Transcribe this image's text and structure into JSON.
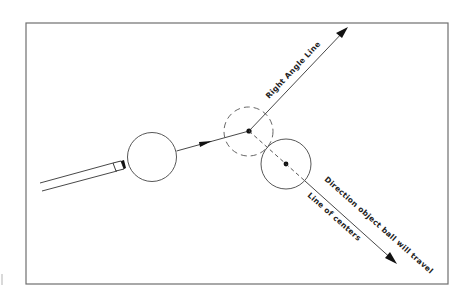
{
  "diagram": {
    "labels": {
      "right_angle_line": "Right Angle Line",
      "direction_object_ball": "Direction object ball will travel",
      "line_of_centers": "Line of centers"
    },
    "elements": {
      "cue_stick": "cue-stick",
      "cue_ball": "cue-ball",
      "ghost_ball": "ghost-ball (dashed, contact position)",
      "object_ball": "object-ball"
    },
    "colors": {
      "line": "#333333",
      "frame": "#6f6f6f",
      "background": "#ffffff"
    }
  }
}
